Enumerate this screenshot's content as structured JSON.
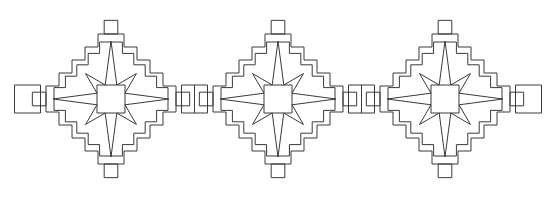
{
  "document": {
    "title": "Stepped Diamond Star Border Pattern",
    "description": "Horizontal repeating ornamental border band of three linked stepped-diamond medallions, each enclosing an eight-pointed star, drawn in thin dark outline on white.",
    "width": 556,
    "height": 199
  },
  "style": {
    "background_color": "#ffffff",
    "line_color": "#3a3a3a",
    "line_width": 1,
    "fill": "none"
  },
  "chart_data": {
    "type": "diagram",
    "grid": false,
    "legend": null,
    "xlabel": "",
    "ylabel": "",
    "xlim": [
      0,
      556
    ],
    "ylim": [
      0,
      199
    ],
    "geometry": {
      "step_unit": 13,
      "center_y": 99,
      "motif_centers_x": [
        111,
        278,
        445
      ],
      "motif_count": 3,
      "connector_centers_x": [
        194.5,
        361.5
      ],
      "edge_connector_centers_x": [
        27.5,
        528.5
      ],
      "star_outer_radius_axis": 58,
      "star_outer_radius_diag": 36,
      "star_inner_half": 14,
      "diamond_outer_half_extent": 84,
      "diamond_inner_offset": 8
    },
    "elements": [
      {
        "name": "motif-1",
        "center": [
          111,
          99
        ],
        "parts": [
          "outer-stepped-diamond",
          "inner-stepped-diamond",
          "eight-point-star",
          "north-tab",
          "south-tab",
          "east-tab",
          "west-tab"
        ]
      },
      {
        "name": "motif-2",
        "center": [
          278,
          99
        ],
        "parts": [
          "outer-stepped-diamond",
          "inner-stepped-diamond",
          "eight-point-star",
          "north-tab",
          "south-tab",
          "east-tab",
          "west-tab"
        ]
      },
      {
        "name": "motif-3",
        "center": [
          445,
          99
        ],
        "parts": [
          "outer-stepped-diamond",
          "inner-stepped-diamond",
          "eight-point-star",
          "north-tab",
          "south-tab",
          "east-tab",
          "west-tab"
        ]
      },
      {
        "name": "connector-1",
        "center": [
          194.5,
          99
        ],
        "parts": [
          "bridge-rectangle",
          "vertical-divider"
        ]
      },
      {
        "name": "connector-2",
        "center": [
          361.5,
          99
        ],
        "parts": [
          "bridge-rectangle",
          "vertical-divider"
        ]
      },
      {
        "name": "edge-connector-left",
        "center": [
          27.5,
          99
        ],
        "parts": [
          "half-bridge-rectangle"
        ]
      },
      {
        "name": "edge-connector-right",
        "center": [
          528.5,
          99
        ],
        "parts": [
          "half-bridge-rectangle"
        ]
      }
    ],
    "star": {
      "points": 8,
      "center_polygon": "square",
      "long_points_direction": [
        "left",
        "right"
      ],
      "medium_points_direction": [
        "up",
        "down"
      ],
      "short_points_direction": [
        "up-left",
        "up-right",
        "down-left",
        "down-right"
      ]
    }
  }
}
